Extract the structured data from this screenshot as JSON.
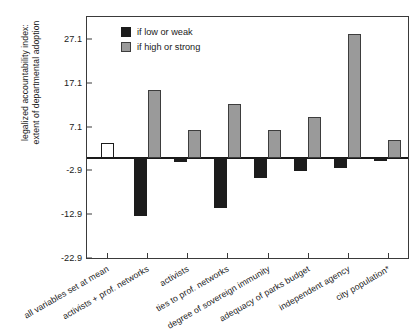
{
  "chart_data": {
    "type": "bar",
    "title": "",
    "xlabel": "",
    "ylabel": "legalized accountability index:\nextent of departmental adoption",
    "ylim": [
      -22.9,
      32.1
    ],
    "yticks": [
      27.1,
      17.1,
      7.1,
      -2.9,
      -12.9,
      -22.9
    ],
    "ytick_labels": [
      "27.1",
      "17.1",
      "7.1",
      "-2.9",
      "-12.9",
      "-22.9"
    ],
    "zero_line": 0,
    "grid": false,
    "legend_position": "top-left",
    "categories": [
      "all variables set at mean",
      "activists + prof. networks",
      "activists",
      "ties to prof. networks",
      "degree of sovereign immunity",
      "adequacy of parks budget",
      "independent agency",
      "city population*"
    ],
    "series": [
      {
        "name": "if low or weak",
        "color": "#1c1c1c",
        "values": [
          null,
          -13.4,
          -1.1,
          -11.5,
          -4.6,
          -3.0,
          -2.3,
          -0.7
        ]
      },
      {
        "name": "if high or strong",
        "color": "#9a9a9a",
        "values": [
          null,
          15.5,
          6.3,
          12.3,
          6.4,
          9.3,
          28.2,
          4.1
        ]
      },
      {
        "name": "baseline",
        "color": "#ffffff",
        "values": [
          3.4,
          null,
          null,
          null,
          null,
          null,
          null,
          null
        ]
      }
    ]
  },
  "legend": {
    "items": [
      {
        "label": "if low or weak",
        "swatch": "black"
      },
      {
        "label": "if high or strong",
        "swatch": "gray"
      }
    ]
  }
}
